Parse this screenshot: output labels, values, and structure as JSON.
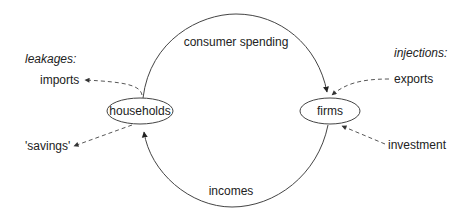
{
  "diagram": {
    "nodes": [
      {
        "id": "households",
        "label": "households"
      },
      {
        "id": "firms",
        "label": "firms"
      }
    ],
    "flows": {
      "top": {
        "label": "consumer spending",
        "from": "households",
        "to": "firms"
      },
      "bottom": {
        "label": "incomes",
        "from": "firms",
        "to": "households"
      }
    },
    "leakages": {
      "heading": "leakages:",
      "items": [
        {
          "label": "imports",
          "from": "households"
        },
        {
          "label": "'savings'",
          "from": "households"
        }
      ]
    },
    "injections": {
      "heading": "injections:",
      "items": [
        {
          "label": "exports",
          "to": "firms"
        },
        {
          "label": "investment",
          "to": "firms"
        }
      ]
    },
    "colors": {
      "line": "#333333",
      "text": "#222222",
      "background": "#ffffff"
    }
  }
}
